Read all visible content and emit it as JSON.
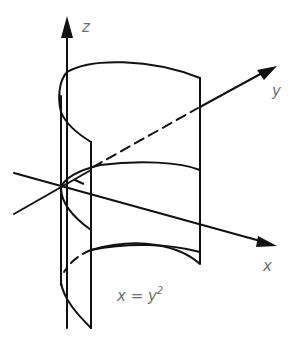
{
  "diagram": {
    "type": "3d-surface-sketch",
    "surface_equation": "x = y",
    "surface_equation_exponent": "2",
    "axes": {
      "z": {
        "label": "z"
      },
      "y": {
        "label": "y"
      },
      "x": {
        "label": "x"
      }
    },
    "colors": {
      "stroke": "#111111",
      "label": "#6e6e6e",
      "background": "#ffffff"
    }
  }
}
